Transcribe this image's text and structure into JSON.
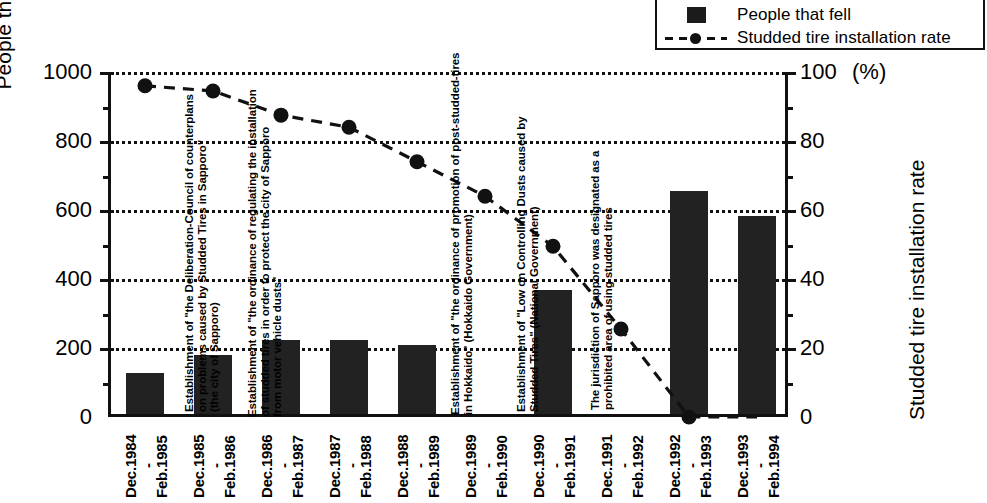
{
  "legend": {
    "items": [
      {
        "label": "People that fell",
        "marker": "filled-square-icon"
      },
      {
        "label": "Studded tire installation rate",
        "marker": "dashed-line-dot-icon"
      }
    ]
  },
  "axes": {
    "left_title": "People that fell",
    "right_title": "Studded tire installation rate",
    "right_unit": "(%)",
    "left_ticks": [
      "0",
      "200",
      "400",
      "600",
      "800",
      "1000"
    ],
    "right_ticks": [
      "0",
      "20",
      "40",
      "60",
      "80",
      "100"
    ]
  },
  "annotations": [
    {
      "id": "anno-deliberation-council",
      "lines": [
        "Establishment of \"the Deliberation-Council of counterplans",
        "on problems caused by Studded Tires in Sapporo\"",
        "(the city of Sapporo)"
      ]
    },
    {
      "id": "anno-sapporo-ordinance",
      "lines": [
        "Establishment of \"the ordinance of regulating the installation",
        "of studded tires in order to protect the city of Sapporo",
        "from motor vehicle dusts\""
      ]
    },
    {
      "id": "anno-hokkaido-ordinance",
      "lines": [
        "Establishment of \"the ordinance of promotion of post-studded-tires",
        "in Hokkaido\" (Hokkaido Government)"
      ]
    },
    {
      "id": "anno-national-law",
      "lines": [
        "Establishment of \"Low on Controlling Dusts caused by",
        "Studded Tires\" (National Government)"
      ]
    },
    {
      "id": "anno-prohibited-area",
      "lines": [
        "The jurisdiction of Sapporo was designated as a",
        "prohibited area of using studded tires"
      ]
    }
  ],
  "chart_data": {
    "type": "bar",
    "title": "",
    "xlabel": "",
    "ylabel": "People that fell",
    "ylim": [
      0,
      1000
    ],
    "y2label": "Studded tire installation rate",
    "y2lim": [
      0,
      100
    ],
    "grid": true,
    "legend_position": "top-right",
    "categories": [
      "Dec.1984 - Feb.1985",
      "Dec.1985 - Feb.1986",
      "Dec.1986 - Feb.1987",
      "Dec.1987 - Feb.1988",
      "Dec.1988 - Feb.1989",
      "Dec.1989 - Feb.1990",
      "Dec.1990 - Feb.1991",
      "Dec.1991 - Feb.1992",
      "Dec.1992 - Feb.1993",
      "Dec.1993 - Feb.1994"
    ],
    "tick_labels": [
      "Dec.1984",
      "Feb.1985",
      "Dec.1985",
      "Feb.1986",
      "Dec.1986",
      "Feb.1987",
      "Dec.1987",
      "Feb.1988",
      "Dec.1988",
      "Feb.1989",
      "Dec.1989",
      "Feb.1990",
      "Dec.1990",
      "Feb.1991",
      "Dec.1991",
      "Feb.1992",
      "Dec.1992",
      "Feb.1993",
      "Dec.1993",
      "Feb.1994"
    ],
    "series": [
      {
        "name": "People that fell",
        "axis": "left",
        "type": "bar",
        "color": "#222222",
        "values": [
          120,
          170,
          215,
          215,
          200,
          0,
          360,
          0,
          645,
          575
        ]
      },
      {
        "name": "Studded tire installation rate",
        "axis": "right",
        "type": "line",
        "color": "#111111",
        "values": [
          96,
          94.5,
          87.5,
          84,
          74,
          64,
          49.5,
          25.5,
          0,
          0
        ]
      }
    ]
  },
  "colors": {
    "bar": "#222222",
    "line": "#111111",
    "axis": "#111111",
    "background": "#ffffff"
  }
}
